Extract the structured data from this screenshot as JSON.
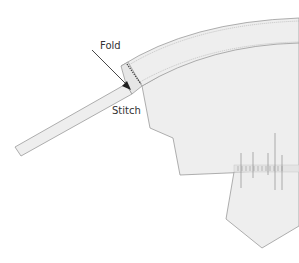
{
  "diagram": {
    "type": "sewing-instruction",
    "labels": {
      "fold": "Fold",
      "stitch": "Stitch"
    },
    "colors": {
      "fabric_fill": "#eeeeee",
      "outline": "#9a9a9a",
      "stitch_line": "#555555",
      "arrow": "#222222",
      "text": "#333333"
    },
    "parts": [
      "curved-band",
      "folded-strip",
      "main-panel",
      "lower-pointed-piece",
      "stitch-marks"
    ]
  }
}
